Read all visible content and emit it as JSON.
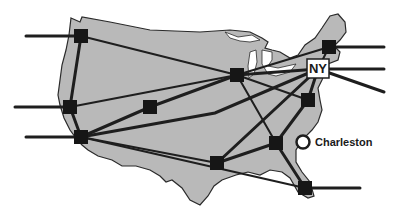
{
  "map": {
    "title": "US network map",
    "colors": {
      "land": "#b9b9b9",
      "outline": "#2a2a2a",
      "link": "#1e1e1e",
      "node": "#161616",
      "water": "#ffffff"
    },
    "hub": {
      "label": "NY",
      "x": 318,
      "y": 69
    },
    "marker": {
      "label": "Charleston",
      "x": 303,
      "y": 142
    },
    "nodes": [
      {
        "id": "seattle",
        "x": 81,
        "y": 36
      },
      {
        "id": "bay-area",
        "x": 70,
        "y": 107
      },
      {
        "id": "los-angeles",
        "x": 81,
        "y": 137
      },
      {
        "id": "denver",
        "x": 150,
        "y": 107
      },
      {
        "id": "chicago",
        "x": 237,
        "y": 75
      },
      {
        "id": "boston",
        "x": 329,
        "y": 47
      },
      {
        "id": "washington",
        "x": 308,
        "y": 100
      },
      {
        "id": "atlanta",
        "x": 276,
        "y": 143
      },
      {
        "id": "dallas",
        "x": 217,
        "y": 163
      },
      {
        "id": "miami",
        "x": 305,
        "y": 188
      }
    ]
  }
}
